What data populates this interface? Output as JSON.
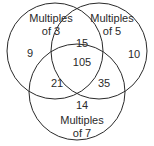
{
  "diagram": {
    "type": "venn",
    "sets": [
      {
        "label_line1": "Multiples",
        "label_line2": "of 3"
      },
      {
        "label_line1": "Multiples",
        "label_line2": "of 5"
      },
      {
        "label_line1": "Multiples",
        "label_line2": "of 7"
      }
    ],
    "regions": {
      "only_3": "9",
      "only_5": "10",
      "only_7": "14",
      "3_and_5": "15",
      "3_and_7": "21",
      "5_and_7": "35",
      "all": "105"
    },
    "colors": {
      "stroke": "#2a2a2a",
      "text": "#2a2a2a"
    }
  }
}
